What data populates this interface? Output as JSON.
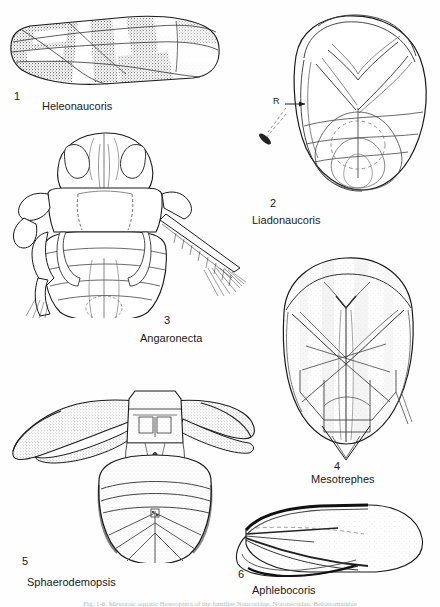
{
  "plate": {
    "width": 440,
    "height": 607,
    "background_color": "#fefefe",
    "ink_color": "#1a1a1a",
    "bottom_caption": "Fig. 1-6.  Mesozoic aquatic Heteroptera of the families Naucoridae, Notonectidae, Belostomatidae"
  },
  "figures": [
    {
      "id": "fig1",
      "number": "1",
      "taxon": "Heleonaucoris",
      "description": "stippled forewing (hemelytron) in dorsal view, elongate with dark mottled pattern",
      "number_pos": {
        "x": 14,
        "y": 91
      },
      "taxon_pos": {
        "x": 42,
        "y": 101
      }
    },
    {
      "id": "fig2",
      "number": "2",
      "taxon": "Liadonaucoris",
      "description": "line-drawn dorsal habitus outline with scutellum and wing venation, arrow label R to radial vein",
      "number_pos": {
        "x": 270,
        "y": 198
      },
      "taxon_pos": {
        "x": 252,
        "y": 215
      },
      "annotations": [
        {
          "label": "R",
          "x": 273,
          "y": 101
        }
      ]
    },
    {
      "id": "fig3",
      "number": "3",
      "taxon": "Angaronecta",
      "description": "dorsal habitus line drawing of a backswimmer with head, pronotum, legs and fringed swimming leg",
      "number_pos": {
        "x": 164,
        "y": 315
      },
      "taxon_pos": {
        "x": 140,
        "y": 333
      }
    },
    {
      "id": "fig4",
      "number": "4",
      "taxon": "Mesotrephes",
      "description": "dorsal view of folded wings and scutellum with light stippling, pointed abdominal tip",
      "number_pos": {
        "x": 334,
        "y": 461
      },
      "taxon_pos": {
        "x": 315,
        "y": 474
      }
    },
    {
      "id": "fig5",
      "number": "5",
      "taxon": "Sphaerodemopsis",
      "description": "dorsal habitus of a giant water bug with broad stippled raptorial forelegs and oval abdomen",
      "number_pos": {
        "x": 22,
        "y": 558
      },
      "taxon_pos": {
        "x": 27,
        "y": 578
      }
    },
    {
      "id": "fig6",
      "number": "6",
      "taxon": "Aphlebocoris",
      "description": "lateral forewing outline, broad rounded apex with dark anterior margin",
      "number_pos": {
        "x": 238,
        "y": 570
      },
      "taxon_pos": {
        "x": 252,
        "y": 586
      }
    }
  ]
}
